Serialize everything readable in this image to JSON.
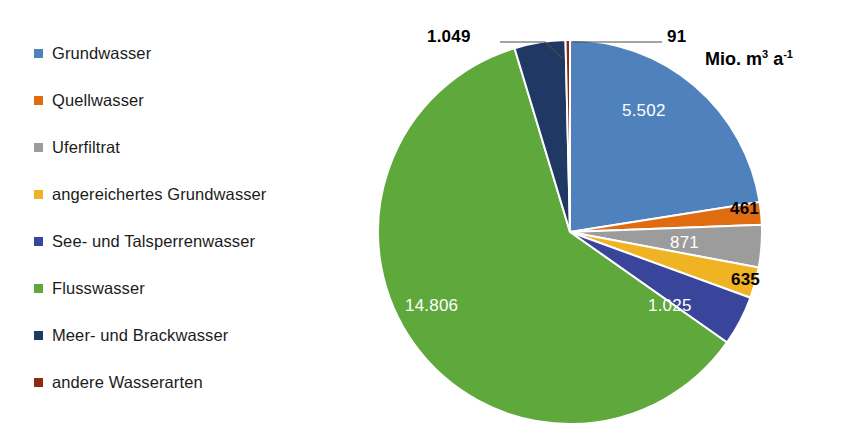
{
  "chart_data": {
    "type": "pie",
    "title": "",
    "unit_label": "Mio. m3 a-1",
    "unit_parts": {
      "prefix": "Mio. m",
      "sup1": "3",
      "mid": " a",
      "sup2": "-1"
    },
    "categories": [
      "Grundwasser",
      "Quellwasser",
      "Uferfiltrat",
      "angereichertes Grundwasser",
      "See- und Talsperrenwasser",
      "Flusswasser",
      "Meer- und Brackwasser",
      "andere Wasserarten"
    ],
    "values": [
      5502,
      461,
      871,
      635,
      1025,
      14806,
      1049,
      91
    ],
    "value_labels": [
      "5.502",
      "461",
      "871",
      "635",
      "1.025",
      "14.806",
      "1.049",
      "91"
    ],
    "colors": [
      "#4F81BD",
      "#E06C12",
      "#9C9C9C",
      "#F0B323",
      "#39459B",
      "#5FA83C",
      "#1F3864",
      "#8C2A12"
    ],
    "total": 24440,
    "legend_position": "left",
    "grid": false,
    "start_angle_deg": 0,
    "label_placement": [
      "inside",
      "outside",
      "inside",
      "outside",
      "inside",
      "inside",
      "leader",
      "leader"
    ]
  },
  "legend": {
    "items": [
      {
        "label": "Grundwasser",
        "color": "#4F81BD"
      },
      {
        "label": "Quellwasser",
        "color": "#E06C12"
      },
      {
        "label": "Uferfiltrat",
        "color": "#9C9C9C"
      },
      {
        "label": "angereichertes Grundwasser",
        "color": "#F0B323"
      },
      {
        "label": "See- und Talsperrenwasser",
        "color": "#39459B"
      },
      {
        "label": "Flusswasser",
        "color": "#5FA83C"
      },
      {
        "label": "Meer- und Brackwasser",
        "color": "#1F3864"
      },
      {
        "label": "andere Wasserarten",
        "color": "#8C2A12"
      }
    ]
  },
  "labels": {
    "grundwasser": "5.502",
    "quellwasser": "461",
    "uferfiltrat": "871",
    "angereichertes_grundwasser": "635",
    "see_talsperrenwasser": "1.025",
    "flusswasser": "14.806",
    "meer_brackwasser": "1.049",
    "andere_wasserarten": "91"
  }
}
